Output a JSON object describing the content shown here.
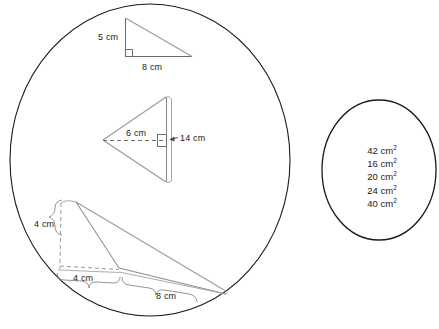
{
  "page": {
    "width": 439,
    "height": 329,
    "background": "#ffffff",
    "stroke_dark": "#1a1a1a",
    "stroke_light": "#8a8a8a",
    "text_color": "#1a1a1a"
  },
  "left_panel": {
    "name": "shapes-ellipse",
    "shape": "ellipse",
    "cx": 150,
    "cy": 160,
    "rx": 140,
    "ry": 156
  },
  "right_panel": {
    "name": "answers-ellipse",
    "shape": "ellipse",
    "cx": 379,
    "cy": 170,
    "rx": 57,
    "ry": 70
  },
  "figures": [
    {
      "id": "triangle-1",
      "label": "right-triangle-upper",
      "description": "right triangle with vertical leg and horizontal base",
      "labels": [
        {
          "text": "5 cm",
          "x": 98,
          "y": 32,
          "name": "triangle-1-height-label"
        },
        {
          "text": "8 cm",
          "x": 142,
          "y": 62,
          "name": "triangle-1-base-label"
        }
      ],
      "right_angle": true
    },
    {
      "id": "triangle-2",
      "label": "left-pointing-triangle",
      "description": "triangle pointing left with dashed height and vertical side",
      "labels": [
        {
          "text": "6 cm",
          "x": 126,
          "y": 128,
          "name": "triangle-2-height-label"
        },
        {
          "text": "14 cm",
          "x": 180,
          "y": 133,
          "name": "triangle-2-side-label"
        }
      ],
      "right_angle": true
    },
    {
      "id": "triangle-3",
      "label": "obtuse-triangle-lower",
      "description": "obtuse triangle drawn in perspective with external height",
      "labels": [
        {
          "text": "4 cm",
          "x": 34,
          "y": 219,
          "name": "triangle-3-height-label"
        },
        {
          "text": "4 cm",
          "x": 73,
          "y": 273,
          "name": "triangle-3-offset-label"
        },
        {
          "text": "8 cm",
          "x": 156,
          "y": 291,
          "name": "triangle-3-base-label"
        }
      ],
      "right_angle": false
    }
  ],
  "answers": {
    "title": "answer-options",
    "items": [
      {
        "value": "42",
        "unit": "cm",
        "exponent": "2"
      },
      {
        "value": "16",
        "unit": "cm",
        "exponent": "2"
      },
      {
        "value": "20",
        "unit": "cm",
        "exponent": "2"
      },
      {
        "value": "24",
        "unit": "cm",
        "exponent": "2"
      },
      {
        "value": "40",
        "unit": "cm",
        "exponent": "2"
      }
    ]
  }
}
